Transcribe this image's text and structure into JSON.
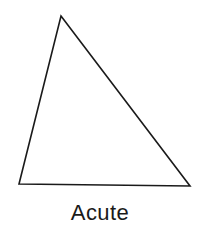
{
  "figure": {
    "label": "Acute",
    "shape_name": "acute-triangle",
    "background_color": "#ffffff",
    "stroke_color": "#1a1a1a",
    "fill_color": "none",
    "stroke_width": 1.6,
    "canvas": {
      "width": 200,
      "height": 231
    },
    "vertices": [
      {
        "name": "apex",
        "x": 61,
        "y": 16
      },
      {
        "name": "bottom-right",
        "x": 190,
        "y": 186
      },
      {
        "name": "bottom-left",
        "x": 19,
        "y": 184
      }
    ],
    "points_attr": "61,16 190,186 19,184",
    "label_color": "#1a1a1a"
  }
}
